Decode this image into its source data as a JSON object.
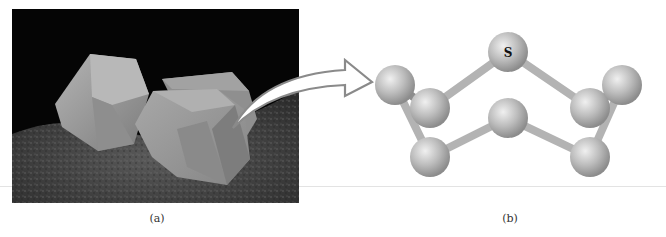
{
  "figure": {
    "panel_a": {
      "caption": "(a)",
      "description": "photograph of sulfur crystals on rock",
      "colors": {
        "background": "#050505",
        "crystal": "#9a9a9a",
        "rock": "#4a4a4a"
      }
    },
    "arrow": {
      "icon": "curved-arrow-icon",
      "colors": {
        "outline": "#8a8a8a",
        "fill": "#ffffff"
      }
    },
    "panel_b": {
      "caption": "(b)",
      "description": "S8 ring ball-and-stick model",
      "atom_label": "S",
      "atom_count": 8,
      "colors": {
        "atom": "#bdbdbd",
        "bond": "#b0b0b0"
      }
    }
  }
}
